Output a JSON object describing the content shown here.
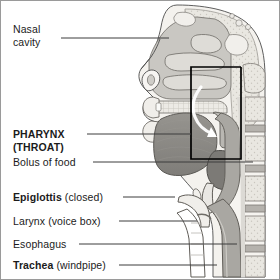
{
  "figure": {
    "type": "anatomical-diagram",
    "view": "mid-sagittal",
    "palette": {
      "background": "#ffffff",
      "border": "#9a9a9a",
      "outline": "#4a4a4a",
      "skin": "#f2f0ec",
      "bone": "#e6e4de",
      "soft_tissue": "#cfcdc8",
      "muscle": "#a8a6a1",
      "tongue": "#8d8b87",
      "bolus": "#7e7c78",
      "airway": "#ffffff",
      "label_text": "#1b1b1b",
      "leader_line": "#3c3c3c",
      "highlight_box": "#000000"
    },
    "highlight_box": {
      "name": "pharynx-highlight-box",
      "x": 190,
      "y": 66,
      "width": 50,
      "height": 92,
      "stroke": "#000000",
      "stroke_width": 1.6
    }
  },
  "labels": [
    {
      "id": "nasal-cavity",
      "bold_text": "",
      "line1": "Nasal",
      "line2": "cavity",
      "normal_text": "",
      "x": 12,
      "y": 22,
      "leader": {
        "x1": 60,
        "y1": 37,
        "x2": 168,
        "y2": 37
      }
    },
    {
      "id": "pharynx-throat",
      "line1": "PHARYNX",
      "line2": "(THROAT)",
      "x": 12,
      "y": 127,
      "leader": {
        "x1": 86,
        "y1": 133,
        "x2": 190,
        "y2": 133
      }
    },
    {
      "id": "bolus-of-food",
      "text": "Bolus of food",
      "x": 12,
      "y": 156,
      "leader": {
        "x1": 92,
        "y1": 161,
        "x2": 252,
        "y2": 161
      }
    },
    {
      "id": "epiglottis",
      "bold_text": "Epiglottis",
      "normal_text": " (closed)",
      "x": 12,
      "y": 191,
      "leader": {
        "x1": 122,
        "y1": 196,
        "x2": 174,
        "y2": 196
      }
    },
    {
      "id": "larynx",
      "text": "Larynx (voice box)",
      "x": 12,
      "y": 215,
      "leader": {
        "x1": 118,
        "y1": 220,
        "x2": 196,
        "y2": 220
      }
    },
    {
      "id": "esophagus",
      "text": "Esophagus",
      "x": 12,
      "y": 238,
      "leader": {
        "x1": 78,
        "y1": 243,
        "x2": 236,
        "y2": 243
      }
    },
    {
      "id": "trachea",
      "bold_text": "Trachea",
      "normal_text": " (windpipe)",
      "x": 12,
      "y": 259,
      "leader": {
        "x1": 118,
        "y1": 264,
        "x2": 216,
        "y2": 264
      }
    }
  ],
  "structures": [
    "nasal cavity with turbinates",
    "frontal sinus",
    "sphenoid sinus",
    "hard palate",
    "soft palate",
    "upper lip",
    "lower lip",
    "teeth",
    "tongue",
    "bolus of food",
    "nasopharynx",
    "oropharynx",
    "laryngopharynx",
    "epiglottis",
    "hyoid bone",
    "thyroid cartilage",
    "vocal folds",
    "larynx",
    "trachea",
    "esophagus",
    "cervical vertebrae",
    "intervertebral discs",
    "spinal cord"
  ]
}
